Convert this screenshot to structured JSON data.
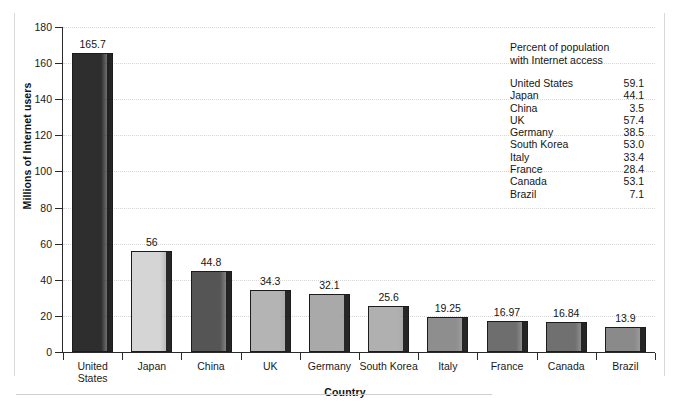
{
  "chart_data": {
    "type": "bar",
    "title": "",
    "xlabel": "Country",
    "ylabel": "Millions of Internet users",
    "ylim": [
      0,
      180
    ],
    "yticks": [
      0,
      20,
      40,
      60,
      80,
      100,
      120,
      140,
      160,
      180
    ],
    "grid": true,
    "legend_position": "inside-top-right",
    "categories": [
      "United States",
      "Japan",
      "China",
      "UK",
      "Germany",
      "South Korea",
      "Italy",
      "France",
      "Canada",
      "Brazil"
    ],
    "category_labels": [
      "United\nStates",
      "Japan",
      "China",
      "UK",
      "Germany",
      "South Korea",
      "Italy",
      "France",
      "Canada",
      "Brazil"
    ],
    "values": [
      165.7,
      56,
      44.8,
      34.3,
      32.1,
      25.6,
      19.25,
      16.97,
      16.84,
      13.9
    ],
    "value_labels": [
      "165.7",
      "56",
      "44.8",
      "34.3",
      "32.1",
      "25.6",
      "19.25",
      "16.97",
      "16.84",
      "13.9"
    ],
    "bar_colors": [
      "#2e2e2e",
      "#d5d5d5",
      "#555555",
      "#b4b4b4",
      "#a9a9a9",
      "#b0b0b0",
      "#8e8e8e",
      "#6e6e6e",
      "#707070",
      "#8a8a8a"
    ],
    "annotation": {
      "title": "Percent of population\nwith Internet access",
      "rows": [
        {
          "country": "United States",
          "percent": "59.1"
        },
        {
          "country": "Japan",
          "percent": "44.1"
        },
        {
          "country": "China",
          "percent": "3.5"
        },
        {
          "country": "UK",
          "percent": "57.4"
        },
        {
          "country": "Germany",
          "percent": "38.5"
        },
        {
          "country": "South Korea",
          "percent": "53.0"
        },
        {
          "country": "Italy",
          "percent": "33.4"
        },
        {
          "country": "France",
          "percent": "28.4"
        },
        {
          "country": "Canada",
          "percent": "53.1"
        },
        {
          "country": "Brazil",
          "percent": "7.1"
        }
      ]
    }
  },
  "colors": {
    "axis": "#2a2a2a",
    "gridline": "#d5d5d8",
    "frame": "#d8d8d8",
    "text": "#151515"
  }
}
